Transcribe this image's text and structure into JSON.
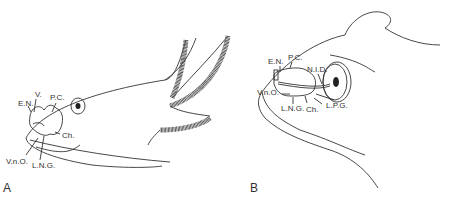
{
  "figure": {
    "panels": [
      {
        "id": "A",
        "label": "A",
        "structures": [
          "E.N.",
          "V.",
          "P.C.",
          "V.n.O.",
          "L.N.G.",
          "Ch."
        ]
      },
      {
        "id": "B",
        "label": "B",
        "structures": [
          "E.N.",
          "P.C.",
          "N.I.D.",
          "V.n.O.",
          "L.N.G.",
          "Ch.",
          "L.P.G."
        ]
      }
    ]
  },
  "panelA": {
    "label": "A",
    "labels": {
      "en": "E.N.",
      "v": "V.",
      "pc": "P.C.",
      "vno": "V.n.O.",
      "lng": "L.N.G.",
      "ch": "Ch."
    }
  },
  "panelB": {
    "label": "B",
    "labels": {
      "en": "E.N.",
      "pc": "P.C.",
      "nid": "N.I.D.",
      "vno": "V.n.O.",
      "lng": "L.N.G.",
      "ch": "Ch.",
      "lpg": "L.P.G."
    }
  }
}
